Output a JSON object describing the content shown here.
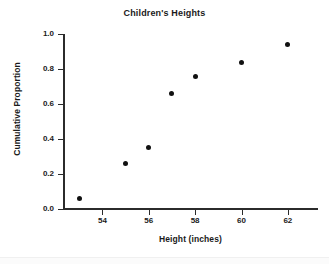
{
  "chart_data": {
    "type": "scatter",
    "title": "Children's Heights",
    "xlabel": "Height (inches)",
    "ylabel": "Cumulative Proportion",
    "xlim": [
      52.3,
      63.3
    ],
    "ylim": [
      0.0,
      1.0
    ],
    "grid": false,
    "legend": null,
    "marker": {
      "shape": "circle",
      "color": "#111111",
      "size": 5
    },
    "x_ticks": [
      54,
      56,
      58,
      60,
      62
    ],
    "x_tick_labels": [
      "54",
      "56",
      "58",
      "60",
      "62"
    ],
    "y_ticks": [
      0.0,
      0.2,
      0.4,
      0.6,
      0.8,
      1.0
    ],
    "y_tick_labels": [
      "0.0",
      "0.2",
      "0.4",
      "0.6",
      "0.8",
      "1.0"
    ],
    "x": [
      53,
      55,
      56,
      57,
      58,
      60,
      62
    ],
    "y": [
      0.06,
      0.26,
      0.35,
      0.66,
      0.76,
      0.84,
      0.94
    ],
    "points": [
      {
        "x": 53,
        "y": 0.06
      },
      {
        "x": 55,
        "y": 0.26
      },
      {
        "x": 56,
        "y": 0.35
      },
      {
        "x": 57,
        "y": 0.66
      },
      {
        "x": 58,
        "y": 0.76
      },
      {
        "x": 60,
        "y": 0.84
      },
      {
        "x": 62,
        "y": 0.94
      }
    ]
  },
  "colors": {
    "background": "#ffffff",
    "axis": "#2b2b2b",
    "text": "#1a1a1a",
    "marker": "#111111"
  }
}
